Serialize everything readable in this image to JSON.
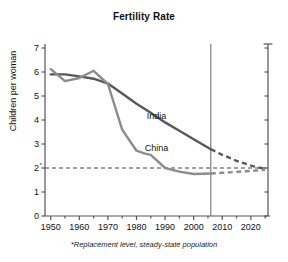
{
  "chart_data": {
    "type": "line",
    "title": "Fertility Rate",
    "xlabel": "",
    "ylabel": "Children per woman",
    "xlim": [
      1948,
      2026
    ],
    "ylim": [
      0,
      7
    ],
    "grid": false,
    "legend_position": "inline-labels",
    "x_ticks_major": [
      1950,
      1960,
      1970,
      1980,
      1990,
      2000,
      2010,
      2020
    ],
    "x_ticks_minor": [
      1955,
      1965,
      1975,
      1985,
      1995,
      2005,
      2015,
      2025
    ],
    "y_ticks": [
      0,
      1,
      2,
      3,
      4,
      5,
      6,
      7
    ],
    "y_tick_labels": [
      "0",
      "1",
      "2*",
      "3",
      "4",
      "5",
      "6",
      "7"
    ],
    "replacement_level": 2.0,
    "replacement_line_style": "dashed",
    "projection_start_year": 2006,
    "projection_divider_style": "solid-vertical",
    "annotations": [
      {
        "text": "India",
        "x": 1987,
        "y": 4.05
      },
      {
        "text": "China",
        "x": 1987,
        "y": 2.72
      }
    ],
    "series": [
      {
        "name": "India",
        "color": "#58585a",
        "historical": {
          "x": [
            1950,
            1955,
            1960,
            1965,
            1970,
            1975,
            1980,
            1985,
            1990,
            1995,
            2000,
            2006
          ],
          "y": [
            5.9,
            5.9,
            5.82,
            5.72,
            5.52,
            5.1,
            4.68,
            4.3,
            3.9,
            3.55,
            3.2,
            2.78
          ]
        },
        "projection": {
          "x": [
            2006,
            2010,
            2015,
            2020,
            2025
          ],
          "y": [
            2.78,
            2.55,
            2.3,
            2.1,
            1.96
          ]
        }
      },
      {
        "name": "China",
        "color": "#8c8c8e",
        "historical": {
          "x": [
            1950,
            1955,
            1960,
            1965,
            1970,
            1975,
            1980,
            1983,
            1985,
            1990,
            1995,
            2000,
            2006
          ],
          "y": [
            6.12,
            5.62,
            5.75,
            6.05,
            5.5,
            3.6,
            2.72,
            2.6,
            2.55,
            2.0,
            1.85,
            1.75,
            1.77
          ]
        },
        "projection": {
          "x": [
            2006,
            2010,
            2015,
            2020,
            2025
          ],
          "y": [
            1.77,
            1.8,
            1.84,
            1.88,
            1.92
          ]
        }
      }
    ]
  },
  "footnote": {
    "text": "*Replacement level, steady-state population"
  }
}
